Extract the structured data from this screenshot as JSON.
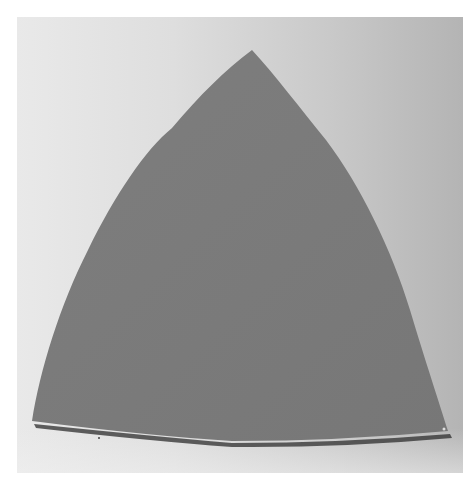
{
  "image": {
    "subject": "curved triangular gray panel photographed against a light backdrop",
    "shape_color": "#7b7b7b",
    "shadow_color": "#2e2e2e",
    "backdrop_left_color": "#e9e9e9",
    "backdrop_right_color": "#b4b4b4",
    "border_color": "#ffffff"
  }
}
